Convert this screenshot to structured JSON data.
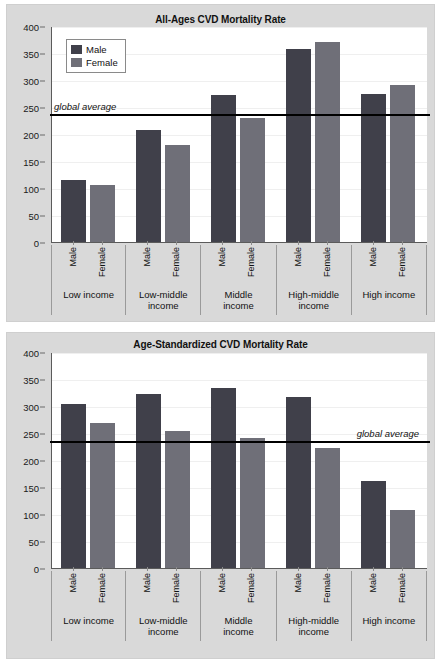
{
  "figure": {
    "background_color": "#d9d9d9",
    "plot_background_color": "#ffffff",
    "male_color": "#40404a",
    "female_color": "#6f6f78",
    "average_line_color": "#000000"
  },
  "legend": {
    "male_label": "Male",
    "female_label": "Female"
  },
  "axis": {
    "ticks": [
      "400",
      "350",
      "300",
      "250",
      "200",
      "150",
      "100",
      "50",
      "0"
    ],
    "values": [
      400,
      350,
      300,
      250,
      200,
      150,
      100,
      50,
      0
    ]
  },
  "annotations": {
    "global_average_label": "global average"
  },
  "chart_data": [
    {
      "type": "bar",
      "id": "all-ages-cvd-mortality-rate",
      "title": "All-Ages CVD Mortality Rate",
      "xlabel": "",
      "ylabel": "",
      "ylim": [
        0,
        400
      ],
      "ytick_step": 50,
      "grid": true,
      "legend_position": "top-left inside",
      "categories": [
        "Low income",
        "Low-middle income",
        "Middle income",
        "High-middle income",
        "High income"
      ],
      "category_lines": [
        [
          "Low income"
        ],
        [
          "Low-middle",
          "income"
        ],
        [
          "Middle",
          "income"
        ],
        [
          "High-middle",
          "income"
        ],
        [
          "High income"
        ]
      ],
      "series": [
        {
          "name": "Male",
          "values": [
            115,
            207,
            272,
            357,
            275
          ]
        },
        {
          "name": "Female",
          "values": [
            105,
            180,
            229,
            370,
            290
          ]
        }
      ],
      "reference_line": {
        "label": "global average",
        "value": 237,
        "label_side": "left"
      }
    },
    {
      "type": "bar",
      "id": "age-standardized-cvd-mortality-rate",
      "title": "Age-Standardized CVD Mortality Rate",
      "xlabel": "",
      "ylabel": "",
      "ylim": [
        0,
        400
      ],
      "ytick_step": 50,
      "grid": true,
      "legend_position": "none",
      "categories": [
        "Low income",
        "Low-middle income",
        "Middle income",
        "High-middle income",
        "High income"
      ],
      "category_lines": [
        [
          "Low income"
        ],
        [
          "Low-middle",
          "income"
        ],
        [
          "Middle",
          "income"
        ],
        [
          "High-middle",
          "income"
        ],
        [
          "High income"
        ]
      ],
      "series": [
        {
          "name": "Male",
          "values": [
            303,
            322,
            334,
            316,
            162
          ]
        },
        {
          "name": "Female",
          "values": [
            268,
            253,
            240,
            223,
            107
          ]
        }
      ],
      "reference_line": {
        "label": "global average",
        "value": 236,
        "label_side": "right"
      }
    }
  ]
}
